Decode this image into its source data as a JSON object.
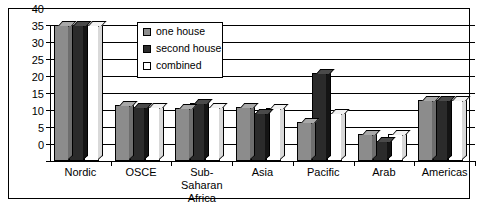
{
  "chart_data": {
    "type": "bar",
    "title": "",
    "subtitle": "",
    "xlabel": "",
    "ylabel": "",
    "ylim": [
      0,
      40
    ],
    "yticks": [
      0,
      5,
      10,
      15,
      20,
      25,
      30,
      35,
      40
    ],
    "ytick_labels": [
      "0",
      "5",
      "10",
      "15",
      "20",
      "25",
      "30",
      "35",
      "40"
    ],
    "grid": true,
    "grid_axis": "y",
    "legend_position": "upper-left-inside",
    "style": "3d-bar",
    "categories": [
      "Nordic",
      "OSCE",
      "Sub-Saharan Africa",
      "Asia",
      "Pacific",
      "Arab",
      "Americas"
    ],
    "category_label_lines": [
      [
        "Nordic"
      ],
      [
        "OSCE"
      ],
      [
        "Sub-",
        "Saharan",
        "Africa"
      ],
      [
        "Asia"
      ],
      [
        "Pacific"
      ],
      [
        "Arab"
      ],
      [
        "Americas"
      ]
    ],
    "series": [
      {
        "name": "one house",
        "color": "#8c8c8c",
        "values": [
          40,
          16.5,
          15.5,
          16,
          11.5,
          8,
          18
        ]
      },
      {
        "name": "second house",
        "color": "#2b2b2b",
        "values": [
          40,
          16,
          17,
          14,
          26,
          6,
          18
        ]
      },
      {
        "name": "combined",
        "color": "#ffffff",
        "values": [
          40,
          16,
          16,
          15.5,
          14,
          8,
          18
        ]
      }
    ]
  },
  "legend": {
    "items": [
      {
        "label": "one house",
        "swatch": "one-house-swatch"
      },
      {
        "label": "second house",
        "swatch": "second-house-swatch"
      },
      {
        "label": "combined",
        "swatch": "combined-swatch"
      }
    ]
  },
  "colors": {
    "one_house": "#8c8c8c",
    "second_house": "#2b2b2b",
    "combined": "#ffffff",
    "axis": "#000000",
    "background": "#ffffff"
  }
}
